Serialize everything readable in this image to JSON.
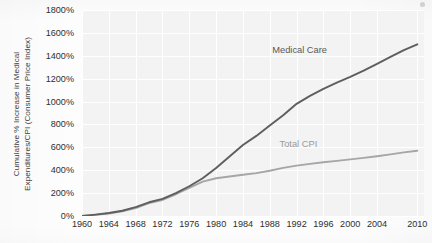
{
  "chart_data": {
    "type": "line",
    "title": "",
    "xlabel": "",
    "ylabel_line1": "Cumulative % Increase in Medical",
    "ylabel_line2": "Expenditures/CPI (Consumer Price Index)",
    "grid": true,
    "legend_position": "inline-right",
    "xlim": [
      1960,
      2011
    ],
    "ylim": [
      0,
      1800
    ],
    "y_tick_labels": [
      "1800%",
      "1600%",
      "1400%",
      "1200%",
      "1000%",
      "800%",
      "600%",
      "400%",
      "200%",
      "0%"
    ],
    "y_ticks": [
      1800,
      1600,
      1400,
      1200,
      1000,
      800,
      600,
      400,
      200,
      0
    ],
    "x_tick_labels": [
      "1960",
      "1964",
      "1968",
      "1972",
      "1976",
      "1980",
      "1984",
      "1988",
      "1992",
      "1996",
      "2000",
      "2004",
      "2010"
    ],
    "x_ticks": [
      1960,
      1964,
      1968,
      1972,
      1976,
      1980,
      1984,
      1988,
      1992,
      1996,
      2000,
      2004,
      2010
    ],
    "series": [
      {
        "name": "Medical Care",
        "color": "#5e5e5e",
        "label_x": 2000,
        "label_y": 1440,
        "x": [
          1960,
          1962,
          1964,
          1966,
          1968,
          1970,
          1972,
          1974,
          1976,
          1978,
          1980,
          1982,
          1984,
          1986,
          1988,
          1990,
          1992,
          1994,
          1996,
          1998,
          2000,
          2002,
          2004,
          2006,
          2008,
          2010
        ],
        "values": [
          0,
          12,
          26,
          46,
          78,
          120,
          150,
          200,
          260,
          330,
          420,
          520,
          620,
          700,
          790,
          880,
          980,
          1050,
          1110,
          1165,
          1215,
          1270,
          1330,
          1390,
          1450,
          1500
        ]
      },
      {
        "name": "Total CPI",
        "color": "#a6a6a6",
        "label_x": 1999,
        "label_y": 620,
        "x": [
          1960,
          1962,
          1964,
          1966,
          1968,
          1970,
          1972,
          1974,
          1976,
          1978,
          1980,
          1982,
          1984,
          1986,
          1988,
          1990,
          1992,
          1994,
          1996,
          1998,
          2000,
          2002,
          2004,
          2006,
          2008,
          2010
        ],
        "values": [
          0,
          10,
          22,
          40,
          70,
          112,
          140,
          190,
          245,
          300,
          330,
          345,
          360,
          375,
          395,
          420,
          440,
          455,
          470,
          482,
          495,
          508,
          522,
          538,
          556,
          570
        ]
      }
    ]
  }
}
